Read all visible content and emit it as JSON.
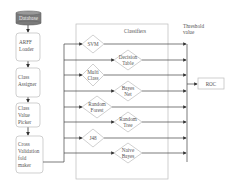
{
  "pipeline": {
    "database": "Database",
    "steps": [
      {
        "lines": [
          "ARFF",
          "Loader"
        ]
      },
      {
        "lines": [
          "Class",
          "Assigner"
        ]
      },
      {
        "lines": [
          "Class",
          "Value",
          "Picker"
        ]
      },
      {
        "lines": [
          "Cross",
          "Validation",
          "fold",
          "maker"
        ]
      }
    ]
  },
  "classifiers": {
    "title": "Classifiers",
    "items": [
      {
        "lines": [
          "SVM"
        ]
      },
      {
        "lines": [
          "Decision",
          "Table"
        ]
      },
      {
        "lines": [
          "Multi",
          "Class"
        ]
      },
      {
        "lines": [
          "Bayes",
          "Net"
        ]
      },
      {
        "lines": [
          "Random",
          "Forest"
        ]
      },
      {
        "lines": [
          "Random",
          "Tree"
        ]
      },
      {
        "lines": [
          "J48"
        ]
      },
      {
        "lines": [
          "Naive",
          "Bayes"
        ]
      }
    ]
  },
  "threshold": {
    "lines": [
      "Threshold",
      "value"
    ]
  },
  "output": {
    "label": "ROC"
  },
  "colors": {
    "line": "#555555",
    "database_fill": "#7a7a7a",
    "box_border": "#bbbbbb"
  }
}
